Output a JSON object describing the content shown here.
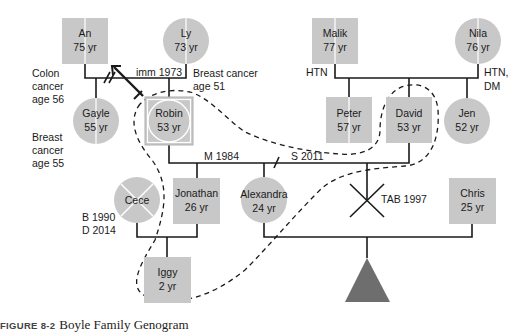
{
  "colors": {
    "node_fill": "#c8c8c8",
    "line": "#1a1a1a",
    "divider": "#ffffff",
    "triangle": "#6e6e6e",
    "caption_num": "#444444"
  },
  "people": {
    "an": {
      "name": "An",
      "age": "75 yr"
    },
    "ly": {
      "name": "Ly",
      "age": "73 yr"
    },
    "malik": {
      "name": "Malik",
      "age": "77 yr"
    },
    "nila": {
      "name": "Nila",
      "age": "76 yr"
    },
    "gayle": {
      "name": "Gayle",
      "age": "55 yr"
    },
    "robin": {
      "name": "Robin",
      "age": "53 yr"
    },
    "peter": {
      "name": "Peter",
      "age": "57 yr"
    },
    "david": {
      "name": "David",
      "age": "53 yr"
    },
    "jen": {
      "name": "Jen",
      "age": "52 yr"
    },
    "cece": {
      "name": "Cece"
    },
    "jonathan": {
      "name": "Jonathan",
      "age": "26 yr"
    },
    "alexandra": {
      "name": "Alexandra",
      "age": "24 yr"
    },
    "chris": {
      "name": "Chris",
      "age": "25 yr"
    },
    "iggy": {
      "name": "Iggy",
      "age": "2 yr"
    }
  },
  "annotations": {
    "an_condition": [
      "Colon",
      "cancer",
      "age 56"
    ],
    "gayle_condition": [
      "Breast",
      "cancer",
      "age 55"
    ],
    "ly_condition": [
      "Breast cancer",
      "age 51"
    ],
    "immigration": "imm 1973",
    "malik_condition": "HTN",
    "nila_condition": [
      "HTN,",
      "DM"
    ],
    "marriage": "M 1984",
    "separation": "S 2011",
    "cece_dates": [
      "B 1990",
      "D 2014"
    ],
    "tab": "TAB 1997"
  },
  "caption": {
    "number": "FIGURE 8-2",
    "title": "Boyle Family Genogram"
  }
}
